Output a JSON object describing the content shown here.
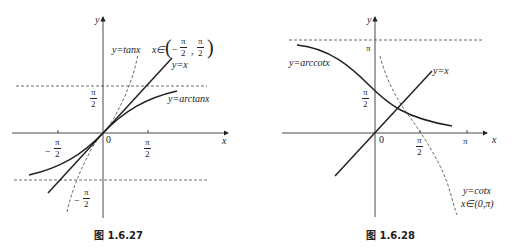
{
  "figures": [
    {
      "id": "fig-left",
      "caption": "图 1.6.27",
      "axis_labels": {
        "x": "x",
        "y": "y",
        "origin": "0"
      },
      "tick_labels": {
        "x_pos": {
          "num": "π",
          "den": "2"
        },
        "x_neg": {
          "sign": "−",
          "num": "π",
          "den": "2"
        },
        "y_pos": {
          "num": "π",
          "den": "2"
        },
        "y_neg": {
          "sign": "−",
          "num": "π",
          "den": "2"
        }
      },
      "curve_labels": {
        "tan": "y=tanx",
        "tan_domain_prefix": "x∈",
        "tan_domain": {
          "open": "(",
          "neg_sign": "−",
          "num": "π",
          "den": "2",
          "sep": ",",
          "close": ")"
        },
        "identity": "y=x",
        "arctan": "y=arctanx"
      }
    },
    {
      "id": "fig-right",
      "caption": "图 1.6.28",
      "axis_labels": {
        "x": "x",
        "y": "y",
        "origin": "0"
      },
      "tick_labels": {
        "x_half_pi": {
          "num": "π",
          "den": "2"
        },
        "x_pi": "π",
        "y_half_pi": {
          "num": "π",
          "den": "2"
        },
        "y_pi": "π"
      },
      "curve_labels": {
        "arccot": "y=arccotx",
        "identity": "y=x",
        "cot": "y=cotx",
        "cot_domain": "x∈(0,π)"
      }
    }
  ],
  "colors": {
    "ink": "#222222",
    "background": "#ffffff"
  }
}
